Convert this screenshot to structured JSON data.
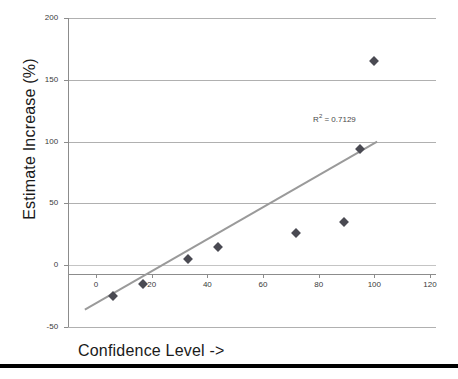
{
  "chart_data": {
    "type": "scatter",
    "title": "",
    "xlabel": "Confidence Level ->",
    "ylabel": "Estimate Increase (%)",
    "xlim": [
      -10,
      122
    ],
    "ylim": [
      -50,
      200
    ],
    "xticks": [
      0,
      20,
      40,
      60,
      80,
      100,
      120
    ],
    "yticks": [
      -50,
      0,
      50,
      100,
      150,
      200
    ],
    "grid": "horizontal",
    "legend": "none",
    "annotations": [
      {
        "text": "R² = 0.7129",
        "base": "R",
        "sup": "2",
        "rest": " = 0.7129",
        "x": 78,
        "y": 118
      }
    ],
    "series": [
      {
        "name": "Estimate Increase",
        "marker": "diamond",
        "color": "#4a4a52",
        "points": [
          {
            "x": 6,
            "y": -25
          },
          {
            "x": 17,
            "y": -15
          },
          {
            "x": 33,
            "y": 5
          },
          {
            "x": 44,
            "y": 15
          },
          {
            "x": 72,
            "y": 26
          },
          {
            "x": 89,
            "y": 35
          },
          {
            "x": 95,
            "y": 94
          },
          {
            "x": 100,
            "y": 165
          }
        ]
      }
    ],
    "trendline": {
      "type": "linear",
      "color": "#9a9a9a",
      "r_squared": 0.7129,
      "x_start": -4,
      "y_start": -36,
      "x_end": 101,
      "y_end": 100
    }
  },
  "axis": {
    "y_tick_labels": [
      "200",
      "150",
      "100",
      "50",
      "0",
      "-50"
    ],
    "x_tick_labels": [
      "0",
      "20",
      "40",
      "60",
      "80",
      "100",
      "120"
    ]
  },
  "labels": {
    "y_axis_title": "Estimate Increase (%)",
    "x_axis_title": "Confidence Level ->"
  }
}
